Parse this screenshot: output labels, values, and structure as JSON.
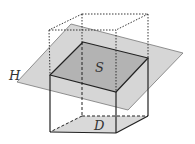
{
  "diagram": {
    "type": "3d-geometry-projection",
    "labels": {
      "plane": "H",
      "section": "S",
      "base": "D"
    },
    "colors": {
      "plane_fill": "#d6d6d6",
      "section_fill": "#b3b3b3",
      "base_fill": "#d9d9d9",
      "stroke": "#222222"
    }
  }
}
